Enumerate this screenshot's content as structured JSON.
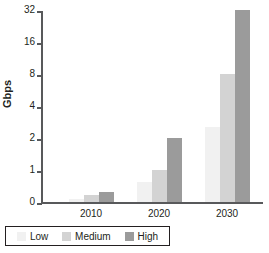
{
  "chart_data": {
    "type": "bar",
    "title": "",
    "xlabel": "",
    "ylabel": "Gbps",
    "categories": [
      "2010",
      "2020",
      "2030"
    ],
    "series": [
      {
        "name": "Low",
        "color": "#f1f1f1",
        "values": [
          0.1,
          0.5,
          3
        ]
      },
      {
        "name": "Medium",
        "color": "#d3d3d3",
        "values": [
          0.2,
          1,
          8
        ]
      },
      {
        "name": "High",
        "color": "#9b9b9b",
        "values": [
          0.3,
          2,
          32
        ]
      }
    ],
    "yscale": "log2",
    "yticks": [
      0,
      1,
      2,
      4,
      8,
      16,
      32
    ],
    "ytick_labels": [
      "0",
      "1",
      "2",
      "4",
      "8",
      "16",
      "32"
    ],
    "ylim": [
      0,
      32
    ],
    "grid": false,
    "legend_position": "bottom-left"
  },
  "axis": {
    "y_title": "Gbps",
    "y_ticks": [
      {
        "label": "32",
        "pos": 3
      },
      {
        "label": "16",
        "pos": 35
      },
      {
        "label": "8",
        "pos": 67
      },
      {
        "label": "4",
        "pos": 99
      },
      {
        "label": "2",
        "pos": 131
      },
      {
        "label": "1",
        "pos": 163
      },
      {
        "label": "0",
        "pos": 195
      }
    ],
    "x_ticks": [
      "2010",
      "2020",
      "2030"
    ]
  },
  "bars": {
    "groups": [
      {
        "category": "2010",
        "left": 26,
        "items": [
          {
            "series": "Low",
            "height": 3,
            "value": 0.1
          },
          {
            "series": "Medium",
            "height": 7,
            "value": 0.2
          },
          {
            "series": "High",
            "height": 10,
            "value": 0.3
          }
        ]
      },
      {
        "category": "2020",
        "left": 94,
        "items": [
          {
            "series": "Low",
            "height": 20,
            "value": 0.5
          },
          {
            "series": "Medium",
            "height": 32,
            "value": 1
          },
          {
            "series": "High",
            "height": 64,
            "value": 2
          }
        ]
      },
      {
        "category": "2030",
        "left": 162,
        "items": [
          {
            "series": "Low",
            "height": 75,
            "value": 3
          },
          {
            "series": "Medium",
            "height": 128,
            "value": 8
          },
          {
            "series": "High",
            "height": 192,
            "value": 32
          }
        ]
      }
    ]
  },
  "legend": {
    "items": [
      {
        "label": "Low",
        "swatch": "low"
      },
      {
        "label": "Medium",
        "swatch": "medium"
      },
      {
        "label": "High",
        "swatch": "high"
      }
    ]
  }
}
